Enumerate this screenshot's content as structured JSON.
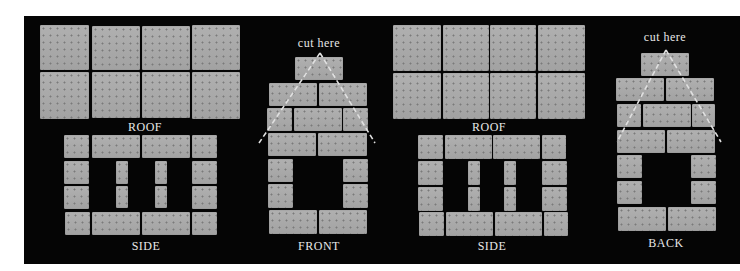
{
  "panels": [
    {
      "id": "roof-1",
      "label": "ROOF"
    },
    {
      "id": "side-1",
      "label": "SIDE"
    },
    {
      "id": "front",
      "label": "FRONT",
      "annotation": "cut here"
    },
    {
      "id": "roof-2",
      "label": "ROOF"
    },
    {
      "id": "side-2",
      "label": "SIDE"
    },
    {
      "id": "back",
      "label": "BACK",
      "annotation": "cut here"
    }
  ],
  "colors": {
    "background": "#050505",
    "cracker": "#a9a9a9",
    "text": "#e8e8e8",
    "cut_line": "#e0e0e0"
  }
}
